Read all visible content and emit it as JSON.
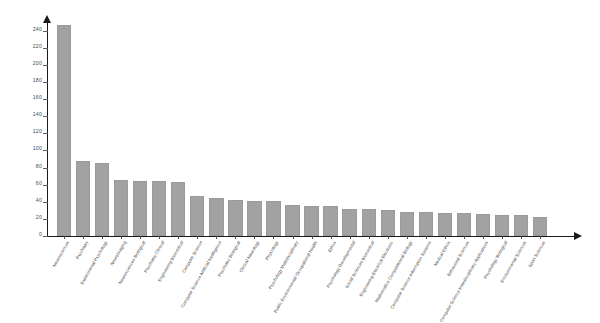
{
  "chart_data": {
    "type": "bar",
    "title": "",
    "subtitle": "",
    "xlabel": "",
    "ylabel": "",
    "ylim": [
      0,
      250
    ],
    "grid": false,
    "legend": false,
    "legend_position": "none",
    "bar_color": "#a2a2a2",
    "axis_color": "#1a1a1a",
    "y_ticks": [
      0,
      20,
      40,
      60,
      80,
      100,
      120,
      140,
      160,
      180,
      200,
      220,
      240
    ],
    "categories": [
      "Neurosciences",
      "Psychiatry",
      "Experimental Psychology",
      "Neuroimaging",
      "Neurosciences Biological",
      "Psychiatry Clinical",
      "Engineering Biomedical",
      "Computer Science",
      "Computer Science Artificial Intelligence",
      "Psychiatry Biological",
      "Clinical Neurology",
      "Physiology",
      "Psychology Multidisciplinary",
      "Public Environmental Occupational Health",
      "Ethics",
      "Psychology Developmental",
      "Social Sciences Biomedical",
      "Engineering Electrical Electronic",
      "Mathematics Computational Biology",
      "Computer Science Information Systems",
      "Medical Ethics",
      "Behavioral Sciences",
      "Computer Science Interdisciplinary Applications",
      "Psychology Biological",
      "Environmental Sciences",
      "Sport Sciences"
    ],
    "values": [
      246,
      88,
      85,
      65,
      64,
      64,
      63,
      47,
      44,
      42,
      41,
      41,
      36,
      35,
      35,
      32,
      31,
      30,
      28,
      28,
      27,
      27,
      26,
      25,
      24,
      22
    ]
  }
}
